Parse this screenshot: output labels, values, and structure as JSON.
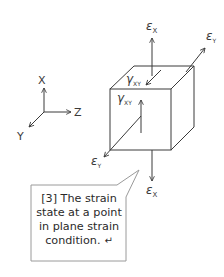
{
  "axes": {
    "x_label": "X",
    "y_label": "Y",
    "z_label": "Z"
  },
  "cube_labels": {
    "epsilon_x_top": {
      "symbol": "ε",
      "sub": "X"
    },
    "epsilon_y_top": {
      "symbol": "ε",
      "sub": "Y"
    },
    "gamma_xy_top": {
      "symbol": "γ",
      "sub": "XY"
    },
    "gamma_xy_front": {
      "symbol": "γ",
      "sub": "XY"
    },
    "epsilon_y_bottom": {
      "symbol": "ε",
      "sub": "Y"
    },
    "epsilon_x_bottom": {
      "symbol": "ε",
      "sub": "X"
    }
  },
  "callout": {
    "lines": [
      "[3] The strain",
      "state at a point",
      "in plane strain",
      "condition."
    ],
    "return_glyph": "↵"
  },
  "colors": {
    "line": "#3a3a3a",
    "callout_border": "#9a9a9a",
    "callout_bg": "#ffffff"
  }
}
